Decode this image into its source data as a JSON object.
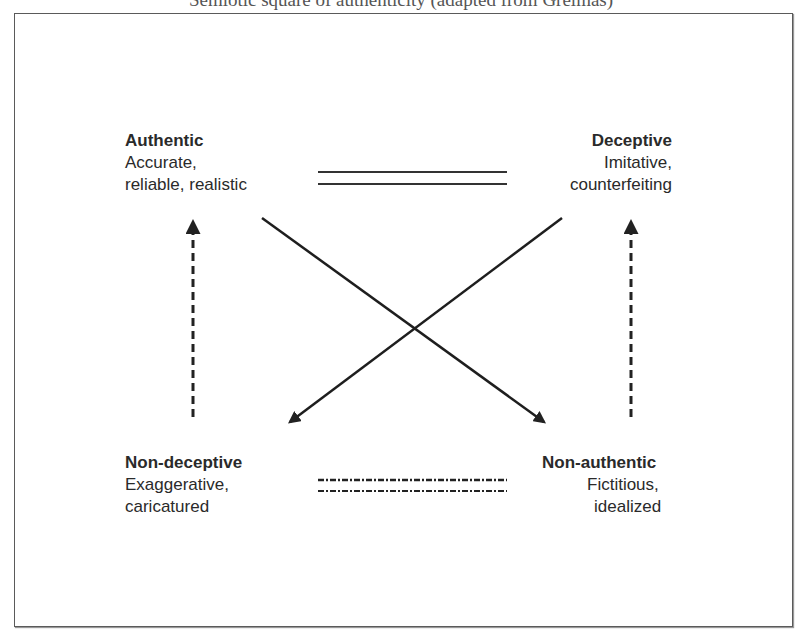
{
  "caption_partial": "...pt... ...g... (... y... ...p...)",
  "diagram": {
    "nodes": {
      "top_left": {
        "title": "Authentic",
        "lines": [
          "Accurate,",
          "reliable, realistic"
        ]
      },
      "top_right": {
        "title": "Deceptive",
        "lines": [
          "Imitative,",
          "counterfeiting"
        ]
      },
      "bottom_left": {
        "title": "Non-deceptive",
        "lines": [
          "Exaggerative,",
          "caricatured"
        ]
      },
      "bottom_right": {
        "title": "Non-authentic",
        "lines": [
          "Fictitious,",
          "idealized"
        ]
      }
    },
    "relations": [
      {
        "from": "Authentic",
        "to": "Deceptive",
        "style": "double-solid",
        "meaning": "contrary"
      },
      {
        "from": "Non-deceptive",
        "to": "Non-authentic",
        "style": "double-dash-dot",
        "meaning": "subcontrary"
      },
      {
        "from": "Authentic",
        "to": "Non-authentic",
        "style": "solid-arrow",
        "meaning": "contradiction"
      },
      {
        "from": "Deceptive",
        "to": "Non-deceptive",
        "style": "solid-arrow",
        "meaning": "contradiction"
      },
      {
        "from": "Non-deceptive",
        "to": "Authentic",
        "style": "dashed-arrow",
        "meaning": "implication"
      },
      {
        "from": "Non-authentic",
        "to": "Deceptive",
        "style": "dashed-arrow",
        "meaning": "implication"
      }
    ],
    "colors": {
      "line": "#222222",
      "text": "#2a2a2a",
      "frame": "#5a5a5a"
    }
  }
}
